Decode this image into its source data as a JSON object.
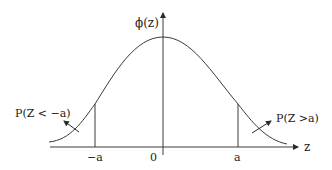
{
  "diagram": {
    "type": "normal-distribution-curve",
    "y_axis_label": "ϕ(z)",
    "x_axis_label": "z",
    "ticks": [
      {
        "label": "−a",
        "x": 95
      },
      {
        "label": "0",
        "x": 153
      },
      {
        "label": "a",
        "x": 237
      }
    ],
    "left_tail_label": "P(Z < −a)",
    "right_tail_label": "P(Z >a)",
    "colors": {
      "line": "#3a3a3a",
      "text": "#222222",
      "background": "#ffffff"
    }
  }
}
